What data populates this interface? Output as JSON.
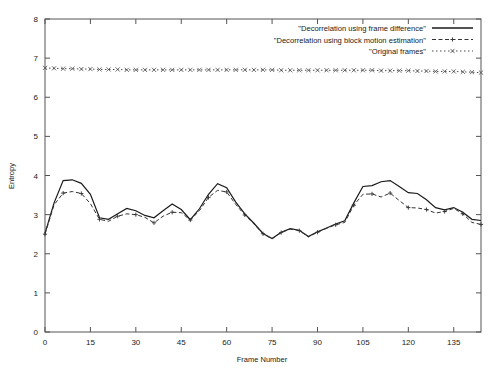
{
  "chart_data": {
    "type": "line",
    "title": "",
    "xlabel": "Frame Number",
    "ylabel": "Entropy",
    "xlim": [
      0,
      144
    ],
    "ylim": [
      0,
      8
    ],
    "xticks": [
      0,
      15,
      30,
      45,
      60,
      75,
      90,
      105,
      120,
      135
    ],
    "yticks": [
      0,
      1,
      2,
      3,
      4,
      5,
      6,
      7,
      8
    ],
    "grid": false,
    "legend_position": "top-right",
    "x": [
      0,
      3,
      6,
      9,
      12,
      15,
      18,
      21,
      24,
      27,
      30,
      33,
      36,
      39,
      42,
      45,
      48,
      51,
      54,
      57,
      60,
      63,
      66,
      69,
      72,
      75,
      78,
      81,
      84,
      87,
      90,
      93,
      96,
      99,
      102,
      105,
      108,
      111,
      114,
      117,
      120,
      123,
      126,
      129,
      132,
      135,
      138,
      141,
      144
    ],
    "series": [
      {
        "name": "\"Decorrelation using frame difference\"",
        "style": "solid",
        "marker": "none",
        "color": "#1a1a1a",
        "values": [
          2.52,
          3.3,
          3.87,
          3.89,
          3.8,
          3.52,
          2.92,
          2.88,
          3.02,
          3.16,
          3.1,
          2.98,
          2.92,
          3.1,
          3.27,
          3.13,
          2.87,
          3.15,
          3.52,
          3.79,
          3.69,
          3.32,
          3.02,
          2.78,
          2.52,
          2.39,
          2.55,
          2.64,
          2.6,
          2.44,
          2.56,
          2.66,
          2.76,
          2.84,
          3.3,
          3.72,
          3.74,
          3.84,
          3.87,
          3.72,
          3.56,
          3.54,
          3.38,
          3.18,
          3.12,
          3.18,
          3.06,
          2.88,
          2.85
        ]
      },
      {
        "name": "\"Decorrelation using block motion estimation\"",
        "style": "dashed",
        "marker": "plus",
        "color": "#333333",
        "values": [
          2.5,
          3.25,
          3.55,
          3.59,
          3.54,
          3.28,
          2.88,
          2.83,
          2.96,
          3.02,
          3.0,
          2.93,
          2.79,
          2.96,
          3.06,
          3.05,
          2.86,
          3.1,
          3.44,
          3.62,
          3.58,
          3.26,
          2.99,
          2.76,
          2.51,
          2.38,
          2.54,
          2.63,
          2.59,
          2.43,
          2.55,
          2.65,
          2.74,
          2.8,
          3.24,
          3.52,
          3.53,
          3.45,
          3.55,
          3.36,
          3.18,
          3.17,
          3.13,
          3.04,
          3.08,
          3.16,
          3.02,
          2.8,
          2.75
        ]
      },
      {
        "name": "\"Original frames\"",
        "style": "dotted",
        "marker": "cross",
        "color": "#4a4a4a",
        "values": [
          6.75,
          6.74,
          6.73,
          6.73,
          6.72,
          6.72,
          6.71,
          6.71,
          6.71,
          6.7,
          6.7,
          6.7,
          6.7,
          6.7,
          6.7,
          6.7,
          6.7,
          6.7,
          6.7,
          6.7,
          6.7,
          6.7,
          6.7,
          6.7,
          6.7,
          6.7,
          6.69,
          6.69,
          6.69,
          6.69,
          6.69,
          6.69,
          6.69,
          6.69,
          6.69,
          6.69,
          6.69,
          6.68,
          6.68,
          6.68,
          6.68,
          6.67,
          6.67,
          6.66,
          6.66,
          6.66,
          6.65,
          6.64,
          6.63
        ]
      }
    ]
  },
  "axes": {
    "ylabel": "Entropy",
    "xlabel": "Frame Number",
    "ytick_labels": [
      "0",
      "1",
      "2",
      "3",
      "4",
      "5",
      "6",
      "7",
      "8"
    ],
    "xtick_labels": [
      "0",
      "15",
      "30",
      "45",
      "60",
      "75",
      "90",
      "105",
      "120",
      "135"
    ]
  },
  "legend": {
    "entries": [
      {
        "label": "\"Decorrelation using frame difference\""
      },
      {
        "label": "\"Decorrelation using block motion estimation\""
      },
      {
        "label": "\"Original frames\""
      }
    ]
  }
}
